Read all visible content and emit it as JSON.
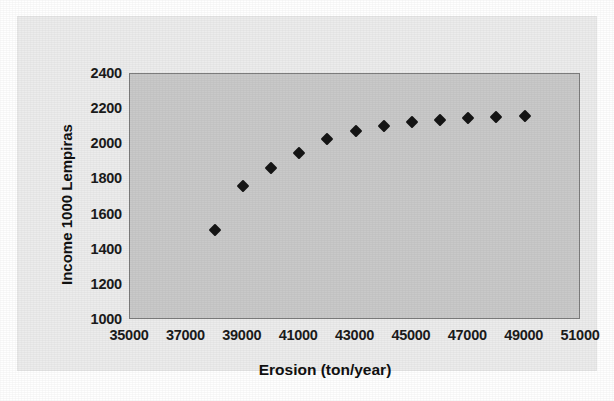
{
  "chart_data": {
    "type": "scatter",
    "title": "",
    "xlabel": "Erosion (ton/year)",
    "ylabel": "Income 1000 Lempiras",
    "xlim": [
      35000,
      51000
    ],
    "ylim": [
      1000,
      2400
    ],
    "xticks": [
      35000,
      37000,
      39000,
      41000,
      43000,
      45000,
      47000,
      49000,
      51000
    ],
    "yticks": [
      1000,
      1200,
      1400,
      1600,
      1800,
      2000,
      2200,
      2400
    ],
    "xtick_labels": [
      "35000",
      "37000",
      "39000",
      "41000",
      "43000",
      "45000",
      "47000",
      "49000",
      "51000"
    ],
    "ytick_labels": [
      "1000",
      "1200",
      "1400",
      "1600",
      "1800",
      "2000",
      "2200",
      "2400"
    ],
    "grid": false,
    "legend": false,
    "legend_position": "none",
    "marker": "diamond",
    "marker_color": "#151515",
    "plot_background": "#c9c9c9",
    "canvas_background": "#ececec",
    "series": [
      {
        "name": "Income vs Erosion",
        "x": [
          38000,
          39000,
          40000,
          41000,
          42000,
          43000,
          44000,
          45000,
          46000,
          47000,
          48000,
          49000
        ],
        "y": [
          1510,
          1765,
          1865,
          1950,
          2030,
          2075,
          2105,
          2125,
          2140,
          2150,
          2158,
          2162
        ]
      }
    ]
  }
}
